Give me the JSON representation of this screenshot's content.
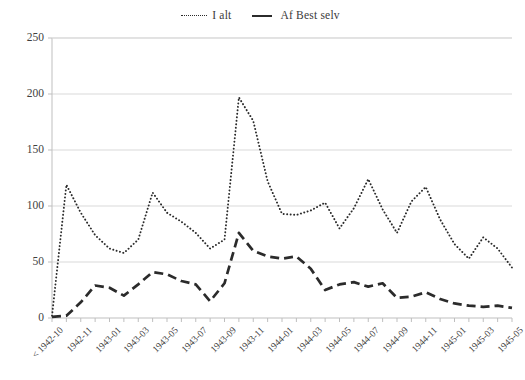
{
  "legend": {
    "position": "top-center",
    "entries": [
      {
        "label": "I alt",
        "style": "dotted",
        "icon": "dotted-line-icon"
      },
      {
        "label": "Af Best selv",
        "style": "dashed",
        "icon": "dashed-line-icon"
      }
    ]
  },
  "axes": {
    "y_ticks": [
      "0",
      "50",
      "100",
      "150",
      "200",
      "250"
    ],
    "x_ticks_visible": [
      "< 1942-10",
      "1942-11",
      "1943-01",
      "1943-03",
      "1943-05",
      "1943-07",
      "1943-09",
      "1943-11",
      "1944-01",
      "1944-03",
      "1944-05",
      "1944-07",
      "1944-09",
      "1944-11",
      "1945-01",
      "1945-03",
      "1945-05"
    ]
  },
  "colors": {
    "line": "#2b2b2b",
    "grid": "#d9d9d9",
    "axis": "#bfbfbf",
    "text": "#3f3f3f",
    "background": "#ffffff"
  },
  "chart_data": {
    "type": "line",
    "title": "",
    "xlabel": "",
    "ylabel": "",
    "ylim": [
      0,
      250
    ],
    "grid": true,
    "legend_position": "top-center",
    "x": [
      "< 1942-10",
      "1942-10",
      "1942-11",
      "1942-12",
      "1943-01",
      "1943-02",
      "1943-03",
      "1943-04",
      "1943-05",
      "1943-06",
      "1943-07",
      "1943-08",
      "1943-09",
      "1943-10",
      "1943-11",
      "1943-12",
      "1944-01",
      "1944-02",
      "1944-03",
      "1944-04",
      "1944-05",
      "1944-06",
      "1944-07",
      "1944-08",
      "1944-09",
      "1944-10",
      "1944-11",
      "1944-12",
      "1945-01",
      "1945-02",
      "1945-03",
      "1945-04",
      "1945-05"
    ],
    "series": [
      {
        "name": "I alt",
        "style": "dotted",
        "values": [
          2,
          119,
          94,
          74,
          62,
          58,
          70,
          112,
          94,
          86,
          76,
          62,
          70,
          197,
          176,
          122,
          93,
          92,
          96,
          103,
          80,
          98,
          124,
          97,
          76,
          104,
          117,
          88,
          66,
          53,
          72,
          62,
          45
        ]
      },
      {
        "name": "Af Best selv",
        "style": "dashed",
        "values": [
          1,
          2,
          14,
          29,
          27,
          20,
          30,
          41,
          39,
          33,
          30,
          15,
          31,
          76,
          60,
          55,
          53,
          55,
          44,
          25,
          30,
          32,
          28,
          31,
          18,
          19,
          23,
          17,
          13,
          11,
          10,
          11,
          9
        ]
      }
    ]
  }
}
